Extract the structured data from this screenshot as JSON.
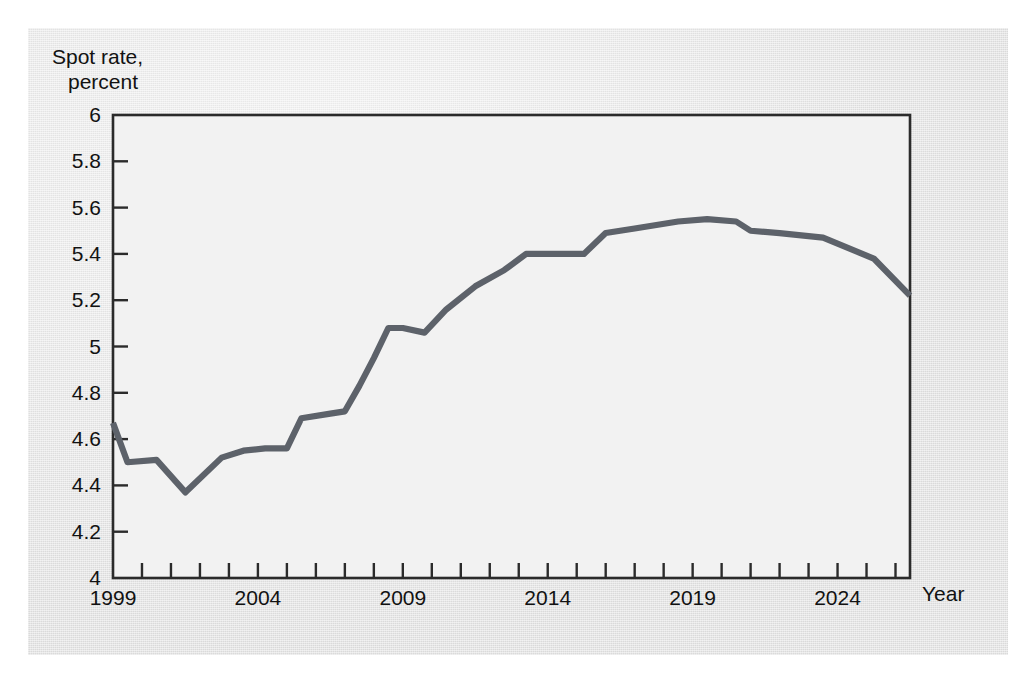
{
  "figure": {
    "y_axis_title_line1": "Spot rate,",
    "y_axis_title_line2": "percent",
    "x_axis_title": "Year",
    "line_color": "#5d626a",
    "axis_color": "#2b2b2b",
    "paper_color": "#e4e4e4",
    "plot_background": "#f2f2f2"
  },
  "chart_data": {
    "type": "line",
    "title": "",
    "subtitle": "",
    "xlabel": "Year",
    "ylabel": "Spot rate, percent",
    "xlim": [
      1999,
      2026.5
    ],
    "ylim": [
      4,
      6
    ],
    "grid": false,
    "legend": "none",
    "y_ticks": [
      4,
      4.2,
      4.4,
      4.6,
      4.8,
      5,
      5.2,
      5.4,
      5.6,
      5.8,
      6
    ],
    "y_tick_labels": [
      "4",
      "4.2",
      "4.4",
      "4.6",
      "4.8",
      "5",
      "5.2",
      "5.4",
      "5.6",
      "5.8",
      "6"
    ],
    "x_ticks": [
      1999,
      2000,
      2001,
      2002,
      2003,
      2004,
      2005,
      2006,
      2007,
      2008,
      2009,
      2010,
      2011,
      2012,
      2013,
      2014,
      2015,
      2016,
      2017,
      2018,
      2019,
      2020,
      2021,
      2022,
      2023,
      2024,
      2025,
      2026
    ],
    "x_tick_labels_shown": [
      "1999",
      "2004",
      "2009",
      "2014",
      "2019",
      "2024"
    ],
    "x_labeled_ticks": [
      1999,
      2004,
      2009,
      2014,
      2019,
      2024
    ],
    "series": [
      {
        "name": "Spot rate",
        "x": [
          1999,
          1999.5,
          2000.5,
          2001.5,
          2002.75,
          2003.5,
          2004.25,
          2005,
          2005.5,
          2006.5,
          2007,
          2007.5,
          2008,
          2008.5,
          2009,
          2009.75,
          2010.5,
          2011.5,
          2012.5,
          2013.25,
          2014,
          2015.25,
          2016,
          2017,
          2018.5,
          2019.5,
          2020.5,
          2021,
          2022,
          2023.5,
          2025.25,
          2026.5
        ],
        "y": [
          4.67,
          4.5,
          4.51,
          4.37,
          4.52,
          4.55,
          4.56,
          4.56,
          4.69,
          4.71,
          4.72,
          4.83,
          4.95,
          5.08,
          5.08,
          5.06,
          5.16,
          5.26,
          5.33,
          5.4,
          5.4,
          5.4,
          5.49,
          5.51,
          5.54,
          5.55,
          5.54,
          5.5,
          5.49,
          5.47,
          5.38,
          5.22
        ]
      }
    ]
  }
}
